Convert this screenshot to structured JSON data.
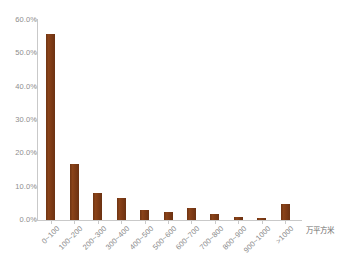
{
  "chart_data": {
    "type": "bar",
    "title": "",
    "subtitle": "",
    "xlabel": "万平方米",
    "ylabel": "",
    "grid": false,
    "legend": null,
    "ylim": [
      0,
      60
    ],
    "ytick_labels": [
      "60.0%",
      "50.0%",
      "40.0%",
      "30.0%",
      "20.0%",
      "10.0%",
      "0.0%"
    ],
    "ytick_values": [
      60,
      50,
      40,
      30,
      20,
      10,
      0
    ],
    "categories": [
      "0~100",
      "100~200",
      "200~300",
      "300~400",
      "400~500",
      "500~600",
      "600~700",
      "700~800",
      "800~900",
      "900~1000",
      ">1000"
    ],
    "values": [
      55.8,
      16.8,
      8.2,
      6.5,
      2.9,
      2.3,
      3.5,
      1.9,
      0.9,
      0.5,
      4.7
    ],
    "value_labels": [
      "55.8%",
      "16.8%",
      "8.2%",
      "6.5%",
      "2.9%",
      "2.3%",
      "3.5%",
      "1.9%",
      "0.9%",
      "0.5%",
      "4.7%"
    ],
    "series": [
      {
        "name": "占比",
        "values": [
          55.8,
          16.8,
          8.2,
          6.5,
          2.9,
          2.3,
          3.5,
          1.9,
          0.9,
          0.5,
          4.7
        ]
      }
    ],
    "colors": {
      "bar": "#7b3a16",
      "axis": "#c9c9c9",
      "tick_text": "#8e8e8e",
      "unit_text": "#6d6d6d",
      "background": "#ffffff"
    }
  }
}
